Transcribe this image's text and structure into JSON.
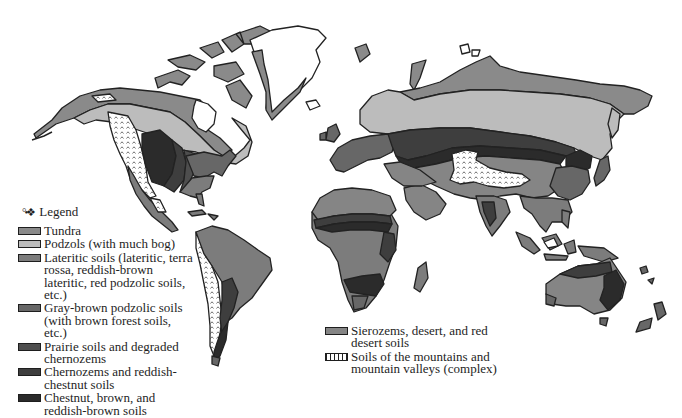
{
  "map": {
    "title": "World soil regions",
    "legend_title": "Legend",
    "legend_glyph": "°•❖",
    "colors": {
      "tundra": "#8a8a8a",
      "podzols": "#bcbcbc",
      "lateritic": "#7c7c7c",
      "gray_brown_podzolic": "#676767",
      "prairie": "#4e4e4e",
      "chernozems": "#3e3e3e",
      "chestnut": "#2b2b2b",
      "sierozems": "#858585",
      "mountains": "#ffffff",
      "outline": "#222222",
      "background": "#ffffff"
    },
    "legend": [
      {
        "key": "tundra",
        "label": "Tundra",
        "color": "#8a8a8a"
      },
      {
        "key": "podzols",
        "label": "Podzols (with much bog)",
        "color": "#bcbcbc"
      },
      {
        "key": "lateritic",
        "label": "Lateritic soils (lateritic, terra rossa, reddish-brown lateritic, red podzolic soils, etc.)",
        "color": "#7c7c7c"
      },
      {
        "key": "gray_brown_podzolic",
        "label": "Gray-brown podzolic soils (with brown forest soils, etc.)",
        "color": "#676767"
      },
      {
        "key": "prairie",
        "label": "Prairie soils and degraded chernozems",
        "color": "#4e4e4e"
      },
      {
        "key": "chernozems",
        "label": "Chernozems and reddish-chestnut soils",
        "color": "#3e3e3e"
      },
      {
        "key": "chestnut",
        "label": "Chestnut, brown, and reddish-brown soils",
        "color": "#2b2b2b"
      }
    ],
    "legend_secondary": [
      {
        "key": "sierozems",
        "label": "Sierozems, desert, and red desert soils",
        "color": "#858585",
        "pattern": false
      },
      {
        "key": "mountains",
        "label": "Soils of the mountains and mountain valleys (complex)",
        "color": "#ffffff",
        "pattern": true
      }
    ]
  }
}
